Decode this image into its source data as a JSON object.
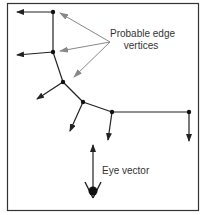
{
  "diagram": {
    "labels": {
      "edge_line1": "Probable edge",
      "edge_line2": "vertices",
      "eye": "Eye vector"
    },
    "colors": {
      "line": "#222222",
      "pointer": "#888888",
      "border": "#333333",
      "background": "#ffffff"
    },
    "nodes": [
      {
        "id": "v1",
        "x": 53,
        "y": 12
      },
      {
        "id": "v2",
        "x": 53,
        "y": 52
      },
      {
        "id": "v3",
        "x": 63,
        "y": 82
      },
      {
        "id": "v4",
        "x": 83,
        "y": 102
      },
      {
        "id": "v5",
        "x": 112,
        "y": 112
      },
      {
        "id": "v6",
        "x": 189,
        "y": 112
      }
    ],
    "edges": [
      [
        "v1",
        "v2"
      ],
      [
        "v2",
        "v3"
      ],
      [
        "v3",
        "v4"
      ],
      [
        "v4",
        "v5"
      ],
      [
        "v5",
        "v6"
      ]
    ],
    "normal_arrows": [
      {
        "from": "v1",
        "to": [
          17,
          12
        ]
      },
      {
        "from": "v2",
        "to": [
          17,
          55
        ]
      },
      {
        "from": "v3",
        "to": [
          37,
          99
        ]
      },
      {
        "from": "v4",
        "to": [
          70,
          131
        ]
      },
      {
        "from": "v5",
        "to": [
          108,
          140
        ]
      },
      {
        "from": "v6",
        "to": [
          189,
          141
        ]
      }
    ],
    "pointer_arrows_from": [
      110,
      42
    ],
    "pointer_arrows_to": [
      [
        60,
        12
      ],
      [
        60,
        51
      ],
      [
        74,
        77
      ]
    ],
    "eye": {
      "x": 93,
      "y": 192,
      "arrow_tip": [
        93,
        145
      ]
    }
  }
}
